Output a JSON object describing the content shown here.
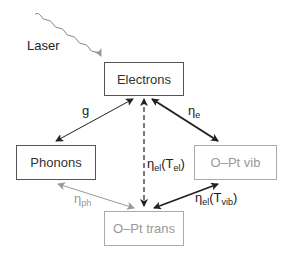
{
  "nodes": {
    "electrons": "Electrons",
    "phonons": "Phonons",
    "opt_vib": "O–Pt vib",
    "opt_trans": "O–Pt trans"
  },
  "source": {
    "laser": "Laser"
  },
  "edges": {
    "g": {
      "label": "g"
    },
    "eta_e": {
      "sym": "η",
      "sub": "e"
    },
    "eta_el_Tel": {
      "sym": "η",
      "sub": "el",
      "arg_open": "(T",
      "arg_sub": "el",
      "arg_close": ")"
    },
    "eta_el_Tvib": {
      "sym": "η",
      "sub": "el",
      "arg_open": "(T",
      "arg_sub": "vib",
      "arg_close": ")"
    },
    "eta_ph": {
      "sym": "η",
      "sub": "ph"
    }
  },
  "colors": {
    "dark": "#222222",
    "light": "#999999"
  }
}
